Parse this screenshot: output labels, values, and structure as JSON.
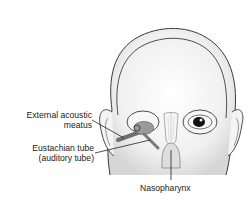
{
  "figure": {
    "labels": {
      "external_acoustic_line1": "External acoustic",
      "external_acoustic_line2": "meatus",
      "eustachian_line1": "Eustachian tube",
      "eustachian_line2": "(auditory tube)",
      "nasopharynx": "Nasopharynx"
    },
    "colors": {
      "outline": "#3a3a3a",
      "skin": "#f2f2f2",
      "shading": "#d9d9d9",
      "ear_structure": "#8a8a8a",
      "label_text": "#222222"
    }
  }
}
